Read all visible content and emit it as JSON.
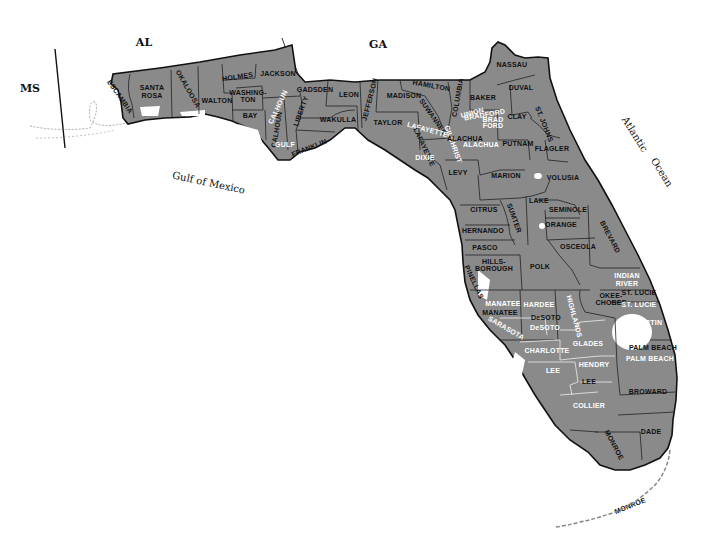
{
  "map": {
    "title": "Florida Counties",
    "land_color": "#8a8a8a",
    "border_color": "#111111",
    "neighbors": [
      {
        "label": "AL",
        "x": 144,
        "y": 46
      },
      {
        "label": "GA",
        "x": 378,
        "y": 48
      },
      {
        "label": "MS",
        "x": 30,
        "y": 92
      }
    ],
    "water_bodies": [
      {
        "label": "Gulf of Mexico",
        "x": 208,
        "y": 186,
        "rotate": 12
      },
      {
        "label": "Atlantic",
        "x": 632,
        "y": 136,
        "rotate": 58
      },
      {
        "label": "Ocean",
        "x": 659,
        "y": 174,
        "rotate": 58
      }
    ],
    "counties": [
      {
        "label": "ESCAMBIA",
        "x": 118,
        "y": 98,
        "rotate": 55,
        "white": false
      },
      {
        "label": "SANTA",
        "x": 152,
        "y": 90,
        "rotate": 0,
        "white": false
      },
      {
        "label": "ROSA",
        "x": 152,
        "y": 98,
        "rotate": 0,
        "white": false
      },
      {
        "label": "OKALOOSA",
        "x": 186,
        "y": 90,
        "rotate": 60,
        "white": false
      },
      {
        "label": "WALTON",
        "x": 217,
        "y": 103,
        "rotate": 0,
        "white": false
      },
      {
        "label": "HOLMES",
        "x": 238,
        "y": 79,
        "rotate": -8,
        "white": false
      },
      {
        "label": "JACKSON",
        "x": 278,
        "y": 76,
        "rotate": 0,
        "white": false
      },
      {
        "label": "WASHING-",
        "x": 248,
        "y": 95,
        "rotate": 0,
        "white": false
      },
      {
        "label": "TON",
        "x": 248,
        "y": 102,
        "rotate": 0,
        "white": false
      },
      {
        "label": "BAY",
        "x": 250,
        "y": 118,
        "rotate": 0,
        "white": false
      },
      {
        "label": "CALHOUN",
        "x": 280,
        "y": 108,
        "rotate": -65,
        "white": true
      },
      {
        "label": "CALHOUN",
        "x": 279,
        "y": 130,
        "rotate": -80,
        "white": false
      },
      {
        "label": "GULF",
        "x": 285,
        "y": 147,
        "rotate": 0,
        "white": true
      },
      {
        "label": "LIBERTY",
        "x": 303,
        "y": 112,
        "rotate": -70,
        "white": false
      },
      {
        "label": "FRANKLIN",
        "x": 310,
        "y": 150,
        "rotate": -22,
        "white": false
      },
      {
        "label": "GADSDEN",
        "x": 315,
        "y": 92,
        "rotate": 0,
        "white": false
      },
      {
        "label": "LEON",
        "x": 349,
        "y": 97,
        "rotate": 0,
        "white": false
      },
      {
        "label": "WAKULLA",
        "x": 338,
        "y": 122,
        "rotate": 0,
        "white": false
      },
      {
        "label": "JEFFERSON",
        "x": 372,
        "y": 100,
        "rotate": -75,
        "white": false
      },
      {
        "label": "MADISON",
        "x": 404,
        "y": 98,
        "rotate": 0,
        "white": false
      },
      {
        "label": "TAYLOR",
        "x": 388,
        "y": 125,
        "rotate": 0,
        "white": false
      },
      {
        "label": "HAMILTON",
        "x": 431,
        "y": 88,
        "rotate": 10,
        "white": false
      },
      {
        "label": "SUWANNEE",
        "x": 431,
        "y": 118,
        "rotate": 55,
        "white": false
      },
      {
        "label": "COLUMBIA",
        "x": 460,
        "y": 98,
        "rotate": -80,
        "white": false
      },
      {
        "label": "LAFAYETTE",
        "x": 427,
        "y": 132,
        "rotate": 15,
        "white": true
      },
      {
        "label": "LAFAYETTE",
        "x": 422,
        "y": 148,
        "rotate": 65,
        "white": false
      },
      {
        "label": "DIXIE",
        "x": 425,
        "y": 160,
        "rotate": 0,
        "white": true
      },
      {
        "label": "GILCHRIST",
        "x": 451,
        "y": 145,
        "rotate": 70,
        "white": true
      },
      {
        "label": "ALACHUA",
        "x": 465,
        "y": 141,
        "rotate": 0,
        "white": false
      },
      {
        "label": "ALACHUA",
        "x": 481,
        "y": 147,
        "rotate": 0,
        "white": true
      },
      {
        "label": "BAKER",
        "x": 483,
        "y": 100,
        "rotate": 0,
        "white": false
      },
      {
        "label": "UNION",
        "x": 473,
        "y": 115,
        "rotate": -15,
        "white": true
      },
      {
        "label": "BRADFORD",
        "x": 485,
        "y": 117,
        "rotate": -10,
        "white": true
      },
      {
        "label": "BRAD",
        "x": 493,
        "y": 122,
        "rotate": 0,
        "white": true
      },
      {
        "label": "FORD",
        "x": 493,
        "y": 128,
        "rotate": 0,
        "white": true
      },
      {
        "label": "NASSAU",
        "x": 512,
        "y": 67,
        "rotate": 0,
        "white": false
      },
      {
        "label": "DUVAL",
        "x": 521,
        "y": 90,
        "rotate": 0,
        "white": false
      },
      {
        "label": "CLAY",
        "x": 517,
        "y": 119,
        "rotate": 0,
        "white": false
      },
      {
        "label": "ST. JOHNS",
        "x": 542,
        "y": 125,
        "rotate": 68,
        "white": false
      },
      {
        "label": "PUTNAM",
        "x": 518,
        "y": 146,
        "rotate": 0,
        "white": false
      },
      {
        "label": "FLAGLER",
        "x": 552,
        "y": 151,
        "rotate": 0,
        "white": false
      },
      {
        "label": "LEVY",
        "x": 458,
        "y": 175,
        "rotate": 0,
        "white": false
      },
      {
        "label": "MARION",
        "x": 506,
        "y": 178,
        "rotate": 0,
        "white": false
      },
      {
        "label": "VOLUSIA",
        "x": 563,
        "y": 180,
        "rotate": 0,
        "white": false
      },
      {
        "label": "CITRUS",
        "x": 484,
        "y": 212,
        "rotate": 0,
        "white": false
      },
      {
        "label": "SUMTER",
        "x": 512,
        "y": 219,
        "rotate": 70,
        "white": false
      },
      {
        "label": "LAKE",
        "x": 539,
        "y": 203,
        "rotate": 0,
        "white": false
      },
      {
        "label": "SEMINOLE",
        "x": 568,
        "y": 212,
        "rotate": 0,
        "white": false
      },
      {
        "label": "ORANGE",
        "x": 561,
        "y": 227,
        "rotate": 0,
        "white": false
      },
      {
        "label": "HERNANDO",
        "x": 483,
        "y": 233,
        "rotate": 0,
        "white": false
      },
      {
        "label": "BREVARD",
        "x": 608,
        "y": 238,
        "rotate": 62,
        "white": false
      },
      {
        "label": "PASCO",
        "x": 485,
        "y": 250,
        "rotate": 0,
        "white": false
      },
      {
        "label": "OSCEOLA",
        "x": 578,
        "y": 249,
        "rotate": 0,
        "white": false
      },
      {
        "label": "HILLS-",
        "x": 494,
        "y": 264,
        "rotate": 0,
        "white": false
      },
      {
        "label": "BOROUGH",
        "x": 494,
        "y": 271,
        "rotate": 0,
        "white": false
      },
      {
        "label": "POLK",
        "x": 540,
        "y": 269,
        "rotate": 0,
        "white": false
      },
      {
        "label": "PINELLAS",
        "x": 472,
        "y": 283,
        "rotate": 65,
        "white": false
      },
      {
        "label": "INDIAN",
        "x": 627,
        "y": 278,
        "rotate": 0,
        "white": true
      },
      {
        "label": "RIVER",
        "x": 627,
        "y": 286,
        "rotate": 0,
        "white": true
      },
      {
        "label": "ST. LUCIE",
        "x": 639,
        "y": 295,
        "rotate": 0,
        "white": false
      },
      {
        "label": "OKEE-",
        "x": 611,
        "y": 298,
        "rotate": 0,
        "white": false
      },
      {
        "label": "CHOBEE",
        "x": 611,
        "y": 305,
        "rotate": 0,
        "white": false
      },
      {
        "label": "ST. LUCIE",
        "x": 639,
        "y": 307,
        "rotate": 0,
        "white": true
      },
      {
        "label": "MANATEE",
        "x": 503,
        "y": 306,
        "rotate": 0,
        "white": true
      },
      {
        "label": "MANATEE",
        "x": 500,
        "y": 315,
        "rotate": 0,
        "white": false
      },
      {
        "label": "HARDEE",
        "x": 539,
        "y": 307,
        "rotate": 0,
        "white": true
      },
      {
        "label": "HIGHLANDS",
        "x": 572,
        "y": 317,
        "rotate": 75,
        "white": true
      },
      {
        "label": "DeSOTO",
        "x": 546,
        "y": 320,
        "rotate": 0,
        "white": false
      },
      {
        "label": "DeSOTO",
        "x": 545,
        "y": 330,
        "rotate": 0,
        "white": true
      },
      {
        "label": "SARASOTA",
        "x": 505,
        "y": 330,
        "rotate": 30,
        "white": true
      },
      {
        "label": "MARTIN",
        "x": 648,
        "y": 325,
        "rotate": 0,
        "white": true
      },
      {
        "label": "CHARLOTTE",
        "x": 547,
        "y": 353,
        "rotate": 0,
        "white": true
      },
      {
        "label": "GLADES",
        "x": 588,
        "y": 346,
        "rotate": 0,
        "white": true
      },
      {
        "label": "PALM BEACH",
        "x": 653,
        "y": 350,
        "rotate": 0,
        "white": false
      },
      {
        "label": "PALM BEACH",
        "x": 650,
        "y": 361,
        "rotate": 0,
        "white": true
      },
      {
        "label": "LEE",
        "x": 553,
        "y": 373,
        "rotate": 0,
        "white": true
      },
      {
        "label": "HENDRY",
        "x": 594,
        "y": 367,
        "rotate": 0,
        "white": true
      },
      {
        "label": "LEE",
        "x": 589,
        "y": 384,
        "rotate": 0,
        "white": false
      },
      {
        "label": "BROWARD",
        "x": 648,
        "y": 394,
        "rotate": 0,
        "white": false
      },
      {
        "label": "COLLIER",
        "x": 589,
        "y": 408,
        "rotate": 0,
        "white": true
      },
      {
        "label": "MONROE",
        "x": 612,
        "y": 446,
        "rotate": 62,
        "white": false
      },
      {
        "label": "DADE",
        "x": 651,
        "y": 434,
        "rotate": 0,
        "white": false
      },
      {
        "label": "MONROE",
        "x": 631,
        "y": 508,
        "rotate": -22,
        "white": false
      }
    ]
  }
}
